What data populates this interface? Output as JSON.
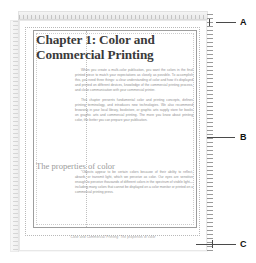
{
  "app": {
    "name": "desktop-publishing-layout-view",
    "canvas_background": "#ffffff",
    "page_background": "#ffffff"
  },
  "rulers": {
    "horizontal_label": "horizontal-ruler",
    "vertical_label": "vertical-ruler",
    "right_label": "right-vertical-ruler",
    "tick_color": "#b6b6b6"
  },
  "document": {
    "title_line1": "Chapter 1: Color and",
    "title_line2": "Commercial Printing",
    "paragraphs": [
      "When you create a multi-color publication, you want the colors in the final printed piece to match your expectations as closely as possible. To accomplish this, you need three things: a clear understanding of color and how it's displayed and printed on different devices, knowledge of the commercial printing process, and close communication with your commercial printer.",
      "This chapter presents fundamental color and printing concepts, defines printing terminology, and introduces new technologies. We also recommend browsing in your local library, bookstore, or graphic arts supply store for books on graphic arts and commercial printing. The more you know about printing color, the better you can prepare your publication."
    ],
    "section_heading": "The properties of color",
    "section_paragraphs": [
      "\"Objects appear to be certain colors because of their ability to reflect, absorb, or transmit light, which we perceive as color. Our eyes are sensitive enough to perceive thousands of different colors in the spectrum of visible light—including many colors that cannot be displayed on a color monitor or printed on a commercial printing press."
    ],
    "footer": "Color and Commercial Printing:  The properties of color"
  },
  "callouts": [
    {
      "letter": "A",
      "name": "callout-a",
      "target": "ruler"
    },
    {
      "letter": "B",
      "name": "callout-b",
      "target": "text-frame"
    },
    {
      "letter": "C",
      "name": "callout-c",
      "target": "footer"
    }
  ],
  "colors": {
    "text_gray": "#8e8e8e",
    "title_gray": "#3a3a3a",
    "heading_gray": "#9b9b9b",
    "guide_gray": "#b9b9b9",
    "frame_gray": "#9d9d9d",
    "callout_black": "#111111"
  }
}
